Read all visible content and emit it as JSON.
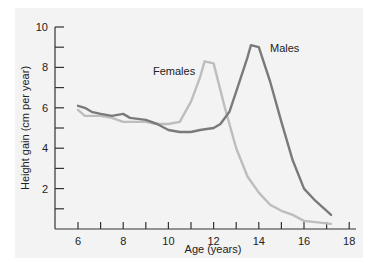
{
  "chart_data": {
    "type": "line",
    "title": "",
    "xlabel": "Age (years)",
    "ylabel": "Height gain (cm per year)",
    "xlim": [
      5.0,
      18.5
    ],
    "ylim": [
      0,
      10
    ],
    "x_ticks": [
      6,
      7,
      8,
      9,
      10,
      11,
      12,
      13,
      14,
      15,
      16,
      17,
      18
    ],
    "x_tick_labels": [
      "6",
      "8",
      "10",
      "12",
      "14",
      "16",
      "18"
    ],
    "y_ticks": [
      1,
      2,
      3,
      4,
      5,
      6,
      7,
      8,
      9,
      10
    ],
    "y_tick_labels": [
      "2",
      "4",
      "6",
      "8",
      "10"
    ],
    "grid": false,
    "legend": "inline labels",
    "series": [
      {
        "name": "Males",
        "color": "#7a7a7a",
        "x": [
          6.0,
          6.3,
          6.6,
          7.0,
          7.5,
          8.0,
          8.3,
          9.0,
          9.5,
          10.0,
          10.5,
          11.0,
          11.4,
          12.0,
          12.3,
          12.7,
          13.0,
          13.5,
          13.65,
          14.0,
          14.5,
          15.0,
          15.5,
          16.0,
          16.5,
          17.2
        ],
        "values": [
          6.1,
          6.0,
          5.8,
          5.7,
          5.6,
          5.7,
          5.5,
          5.4,
          5.2,
          4.9,
          4.8,
          4.8,
          4.9,
          5.0,
          5.2,
          5.8,
          6.8,
          8.5,
          9.1,
          9.0,
          7.3,
          5.3,
          3.4,
          2.0,
          1.4,
          0.7
        ]
      },
      {
        "name": "Females",
        "color": "#bdbdbd",
        "x": [
          6.0,
          6.3,
          7.0,
          7.5,
          8.0,
          8.5,
          9.0,
          9.5,
          10.0,
          10.5,
          11.0,
          11.4,
          11.6,
          12.0,
          12.5,
          13.0,
          13.5,
          14.0,
          14.5,
          15.0,
          15.5,
          16.0,
          17.2
        ],
        "values": [
          5.9,
          5.6,
          5.6,
          5.5,
          5.3,
          5.3,
          5.3,
          5.2,
          5.2,
          5.3,
          6.3,
          7.5,
          8.3,
          8.2,
          6.0,
          4.0,
          2.6,
          1.8,
          1.2,
          0.9,
          0.7,
          0.4,
          0.25
        ]
      }
    ],
    "annotations": [
      {
        "text": "Females",
        "x": 10.8,
        "y": 7.9
      },
      {
        "text": "Males",
        "x": 14.2,
        "y": 8.9
      }
    ]
  },
  "labels": {
    "y_axis": "Height gain (cm per year)",
    "x_axis": "Age (years)",
    "females": "Females",
    "males": "Males"
  }
}
